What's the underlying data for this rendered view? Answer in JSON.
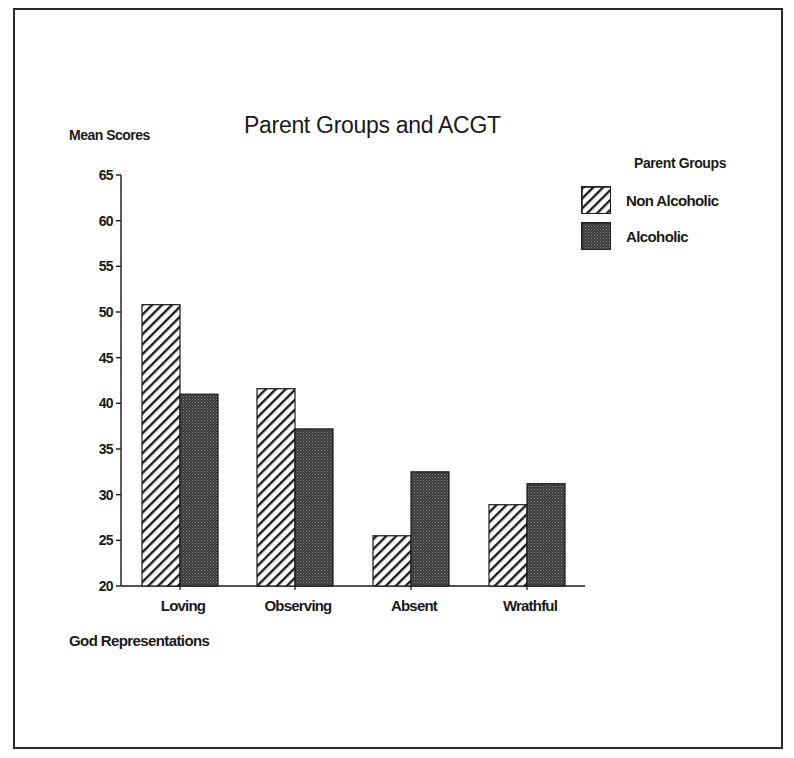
{
  "chart_data": {
    "type": "bar",
    "title": "Parent Groups and ACGT",
    "ylabel": "Mean Scores",
    "xlabel": "God Representations",
    "categories": [
      "Loving",
      "Observing",
      "Absent",
      "Wrathful"
    ],
    "series": [
      {
        "name": "Non Alcoholic",
        "pattern": "diagonal-hatch",
        "values": [
          50.8,
          41.6,
          25.5,
          28.9
        ]
      },
      {
        "name": "Alcoholic",
        "pattern": "dark-stipple",
        "values": [
          41.0,
          37.2,
          32.5,
          31.2
        ]
      }
    ],
    "ylim": [
      20,
      65
    ],
    "yticks": [
      20,
      25,
      30,
      35,
      40,
      45,
      50,
      55,
      60,
      65
    ],
    "grid": false,
    "legend_title": "Parent Groups",
    "legend_position": "upper-right"
  },
  "colors": {
    "ink": "#1a1a1a",
    "hatch_bg": "#ffffff",
    "stipple": "#2b2b2b"
  }
}
